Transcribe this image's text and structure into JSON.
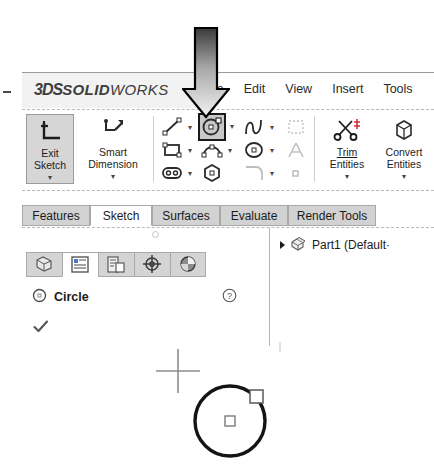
{
  "app": {
    "brand_3ds": "3DS",
    "brand_solid": "SOLID",
    "brand_works": "WORKS",
    "brand_full": "3DS SOLIDWORKS"
  },
  "menubar": {
    "items": [
      {
        "label": "le",
        "full": "File",
        "name": "menu-file",
        "clipped": true
      },
      {
        "label": "Edit",
        "name": "menu-edit",
        "clipped": false
      },
      {
        "label": "View",
        "name": "menu-view",
        "clipped": false
      },
      {
        "label": "Insert",
        "name": "menu-insert",
        "clipped": false
      },
      {
        "label": "Tools",
        "name": "menu-tools",
        "clipped": false
      }
    ]
  },
  "ribbon": {
    "exit_sketch": {
      "line1": "Exit",
      "line2": "Sketch",
      "caret": "▾",
      "state": "pressed"
    },
    "smart_dimension": {
      "line1": "Smart",
      "line2": "Dimension",
      "caret": "▾"
    },
    "trim_entities": {
      "line1": "Trim",
      "line2": "Entities",
      "caret": "▾"
    },
    "convert_entities": {
      "line1": "Convert",
      "line2": "Entities",
      "caret": "▾"
    },
    "tools": [
      {
        "name": "line-tool",
        "caret": "▾",
        "selected": false
      },
      {
        "name": "circle-tool",
        "caret": "▾",
        "selected": true
      },
      {
        "name": "spline-tool",
        "caret": "▾",
        "selected": false
      },
      {
        "name": "plane-tool",
        "caret": "",
        "selected": false
      },
      {
        "name": "rectangle-tool",
        "caret": "▾",
        "selected": false
      },
      {
        "name": "arc-tool",
        "caret": "▾",
        "selected": false
      },
      {
        "name": "ellipse-tool",
        "caret": "▾",
        "selected": false
      },
      {
        "name": "text-tool",
        "caret": "",
        "selected": false
      },
      {
        "name": "slot-tool",
        "caret": "▾",
        "selected": false
      },
      {
        "name": "polygon-tool",
        "caret": "",
        "selected": false
      },
      {
        "name": "fillet-tool",
        "caret": "▾",
        "selected": false
      },
      {
        "name": "point-tool",
        "caret": "",
        "selected": false
      }
    ]
  },
  "command_tabs": [
    {
      "label": "Features",
      "name": "tab-features",
      "active": false,
      "left": 0,
      "width": 68
    },
    {
      "label": "Sketch",
      "name": "tab-sketch",
      "active": true,
      "left": 68,
      "width": 62
    },
    {
      "label": "Surfaces",
      "name": "tab-surfaces",
      "active": false,
      "left": 130,
      "width": 68
    },
    {
      "label": "Evaluate",
      "name": "tab-evaluate",
      "active": false,
      "left": 198,
      "width": 68
    },
    {
      "label": "Render Tools",
      "name": "tab-render-tools",
      "active": false,
      "left": 266,
      "width": 88
    }
  ],
  "manager": {
    "tabs": [
      {
        "name": "feature-manager-tab",
        "active": false
      },
      {
        "name": "property-manager-tab",
        "active": true
      },
      {
        "name": "configuration-manager-tab",
        "active": false
      },
      {
        "name": "dimxpert-manager-tab",
        "active": false
      },
      {
        "name": "display-manager-tab",
        "active": false
      }
    ],
    "property": {
      "title": "Circle",
      "help_glyph": "?",
      "ok_glyph": "✓"
    }
  },
  "tree": {
    "root_label": "Part1 (Default·",
    "expand_glyph": "▸"
  },
  "canvas": {
    "circle": {
      "cx": 230,
      "cy": 420,
      "r": 35
    },
    "center_handle": {
      "x": 230,
      "y": 420
    },
    "edge_handle": {
      "x": 255,
      "y": 395
    },
    "cursor": {
      "x": 178,
      "y": 370
    }
  },
  "annotation": {
    "type": "down-arrow",
    "points_to": "circle-tool",
    "color_top": "#3a3a3a",
    "color_bottom": "#f0f0f0",
    "outline": "#000000"
  },
  "colors": {
    "pressed_button": "#d6d6d6",
    "tab_inactive": "#d2d2d2",
    "tab_active": "#ffffff",
    "sketch_entity": "#111111",
    "panel_border": "#b5b5b5"
  }
}
